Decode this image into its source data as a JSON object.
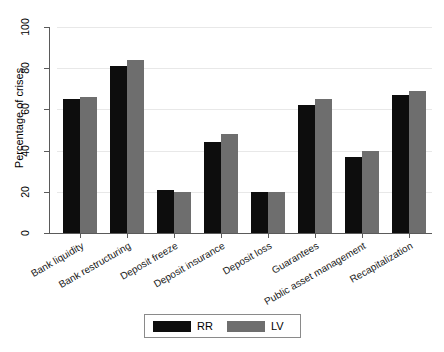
{
  "chart_data": {
    "type": "bar",
    "title": "",
    "subtitle": "",
    "xlabel": "",
    "ylabel": "Percentage of crises",
    "ylim": [
      0,
      100
    ],
    "yticks": [
      0,
      20,
      40,
      60,
      80,
      100
    ],
    "ytick_labels": [
      "0",
      "20",
      "40",
      "60",
      "80",
      "100"
    ],
    "grid": "horizontal",
    "legend_position": "bottom-center",
    "orientation": "vertical",
    "grouping": "grouped",
    "categories": [
      "Bank liquidity",
      "Bank restructuring",
      "Deposit freeze",
      "Deposit insurance",
      "Deposit loss",
      "Guarantees",
      "Public asset management",
      "Recapitalization"
    ],
    "series": [
      {
        "name": "RR",
        "color": "#0d0d0d",
        "values": [
          65,
          81,
          21,
          44,
          20,
          62,
          37,
          67
        ]
      },
      {
        "name": "LV",
        "color": "#6e6e6e",
        "values": [
          66,
          84,
          20,
          48,
          20,
          65,
          40,
          69
        ]
      }
    ]
  },
  "legend": {
    "entries": [
      {
        "label": "RR",
        "swatch": "#0d0d0d"
      },
      {
        "label": "LV",
        "swatch": "#6e6e6e"
      }
    ]
  },
  "colors": {
    "series_rr": "#0d0d0d",
    "series_lv": "#6e6e6e",
    "gridline": "#e8e8e8",
    "axis": "#5a5a5a",
    "background": "#ffffff"
  }
}
